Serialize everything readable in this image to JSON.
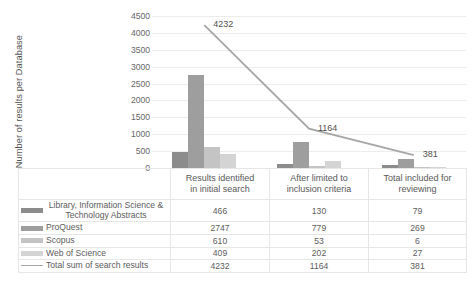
{
  "chart_data": {
    "type": "bar",
    "title": "",
    "xlabel": "",
    "ylabel": "Number of results per Database",
    "ylim": [
      0,
      4500
    ],
    "yticks": [
      0,
      500,
      1000,
      1500,
      2000,
      2500,
      3000,
      3500,
      4000,
      4500
    ],
    "ytick_labels": [
      "0",
      "500",
      "1000",
      "1500",
      "2000",
      "2500",
      "3000",
      "3500",
      "4000",
      "4500"
    ],
    "grid": true,
    "legend_position": "data-table",
    "categories": [
      "Results identified in initial search",
      "After limited to inclusion criteria",
      "Total included for reviewing"
    ],
    "category_lines": [
      [
        "Results identified",
        "in initial search"
      ],
      [
        "After limited to",
        "inclusion criteria"
      ],
      [
        "Total included for",
        "reviewing"
      ]
    ],
    "series": [
      {
        "name": "Library, Information Science & Technology Abstracts",
        "name_lines": [
          "Library, Information Science &",
          "Technology Abstracts"
        ],
        "type": "bar",
        "color": "#8c8c8c",
        "values": [
          466,
          130,
          79
        ]
      },
      {
        "name": "ProQuest",
        "name_lines": [
          "ProQuest"
        ],
        "type": "bar",
        "color": "#9e9e9e",
        "values": [
          2747,
          779,
          269
        ]
      },
      {
        "name": "Scopus",
        "name_lines": [
          "Scopus"
        ],
        "type": "bar",
        "color": "#c4c4c4",
        "values": [
          610,
          53,
          6
        ]
      },
      {
        "name": "Web of Science",
        "name_lines": [
          "Web of Science"
        ],
        "type": "bar",
        "color": "#d4d4d4",
        "values": [
          409,
          202,
          27
        ]
      },
      {
        "name": "Total sum of search results",
        "name_lines": [
          "Total sum of search results"
        ],
        "type": "line",
        "color": "#a6a6a6",
        "values": [
          4232,
          1164,
          381
        ],
        "data_labels": [
          "4232",
          "1164",
          "381"
        ]
      }
    ]
  },
  "table": {
    "rows": [
      {
        "label": "Library, Information Science & Technology Abstracts",
        "values": [
          "466",
          "130",
          "79"
        ]
      },
      {
        "label": "ProQuest",
        "values": [
          "2747",
          "779",
          "269"
        ]
      },
      {
        "label": "Scopus",
        "values": [
          "610",
          "53",
          "6"
        ]
      },
      {
        "label": "Web of Science",
        "values": [
          "409",
          "202",
          "27"
        ]
      },
      {
        "label": "Total sum of search results",
        "values": [
          "4232",
          "1164",
          "381"
        ]
      }
    ]
  }
}
